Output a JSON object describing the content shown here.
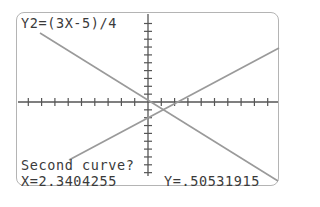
{
  "calculator_screen": {
    "equation_label": "Y2=(3X-5)/4",
    "prompt": "Second curve?",
    "cursor": {
      "x_readout": "X=2.3404255",
      "y_readout": "Y=.50531915"
    }
  },
  "colors": {
    "border": "#b4b4b4",
    "axes": "#555555",
    "graph_lines": "#9a9a9a",
    "text": "#3a3a3a",
    "background": "#ffffff"
  },
  "graph": {
    "curves": [
      {
        "name": "Y1",
        "direction": "descending"
      },
      {
        "name": "Y2",
        "expression": "(3X-5)/4",
        "direction": "ascending"
      }
    ],
    "intersection_approx": {
      "x": 2.3404255,
      "y": 0.50531915
    }
  }
}
